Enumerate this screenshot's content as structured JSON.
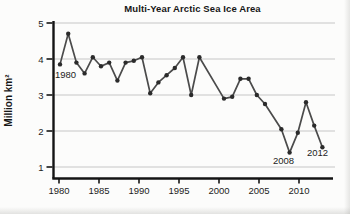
{
  "figure": {
    "title": "Multi-Year Arctic Sea Ice Area",
    "y_axis_label": "Million km²",
    "point_labels": {
      "start_year": "1980",
      "low_year": "2008",
      "end_year": "2012"
    }
  },
  "chart_data": {
    "type": "line",
    "title": "Multi-Year Arctic Sea Ice Area",
    "xlabel": "",
    "ylabel": "Million km²",
    "x": [
      1980,
      1981,
      1982,
      1983,
      1984,
      1985,
      1986,
      1987,
      1988,
      1989,
      1990,
      1991,
      1992,
      1993,
      1994,
      1995,
      1996,
      1997,
      1998,
      1999,
      2000,
      2001,
      2002,
      2003,
      2004,
      2005,
      2006,
      2007,
      2008,
      2009,
      2010,
      2011,
      2012
    ],
    "values": [
      3.85,
      4.7,
      3.9,
      3.6,
      4.05,
      3.8,
      3.9,
      3.4,
      3.9,
      3.95,
      4.05,
      3.05,
      3.35,
      3.55,
      3.75,
      4.05,
      3.0,
      4.05,
      null,
      null,
      2.9,
      2.95,
      3.45,
      3.45,
      3.0,
      2.75,
      null,
      2.05,
      1.4,
      1.95,
      2.8,
      2.15,
      1.55
    ],
    "x_ticks": [
      1980,
      1985,
      1990,
      1995,
      2000,
      2005,
      2010
    ],
    "y_ticks": [
      1,
      2,
      3,
      4,
      5
    ],
    "ylim": [
      0.7,
      5
    ],
    "xlim": [
      1979,
      2013.8
    ],
    "grid": "horizontal-only",
    "legend": "none",
    "annotations": [
      "1980",
      "2008",
      "2012"
    ],
    "colors": {
      "line": "#4b4b4b",
      "dot": "#2b2b2b",
      "grid": "#c6c6c6",
      "axis": "#141414",
      "text": "#1c1c1c"
    }
  }
}
